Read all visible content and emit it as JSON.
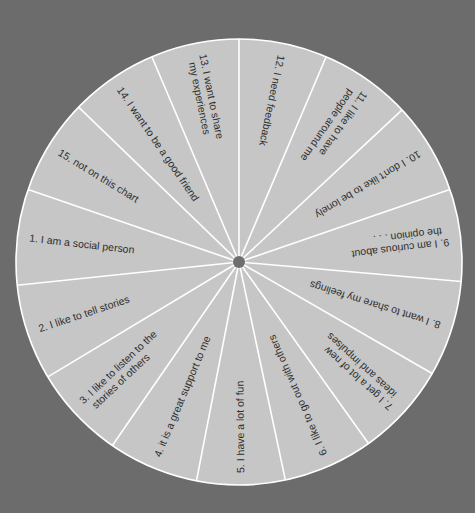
{
  "chart_data": {
    "type": "pie",
    "title": "",
    "center": [
      239,
      262
    ],
    "radius": 223,
    "hub_radius": 6,
    "colors": {
      "background": "#6c6c6c",
      "slice_fill": "#c6c6c6",
      "divider": "#ffffff",
      "hub": "#6e6e6e",
      "text": "#2e2e2e"
    },
    "boundaries_deg": [
      -90,
      -67,
      -43,
      -19,
      5,
      30,
      54.5,
      78,
      101,
      124.6,
      149,
      174,
      199,
      224,
      247
    ],
    "segments": [
      {
        "number": "12.",
        "lines": [
          "12.  I need feedback"
        ],
        "start": -90,
        "end": -67,
        "value": 1
      },
      {
        "number": "11.",
        "lines": [
          "11.  I like to have",
          "people around me"
        ],
        "start": -67,
        "end": -43,
        "value": 1
      },
      {
        "number": "10.",
        "lines": [
          "10.  I don't like to be lonely"
        ],
        "start": -43,
        "end": -19,
        "value": 1
      },
      {
        "number": "9.",
        "lines": [
          "9.  I am curious about",
          "the opinion . . ."
        ],
        "start": -19,
        "end": 5,
        "value": 1
      },
      {
        "number": "8.",
        "lines": [
          "8.  I want to share my feelings"
        ],
        "start": 5,
        "end": 30,
        "value": 1
      },
      {
        "number": "7.",
        "lines": [
          "7.  I get a lot of new",
          "ideas and impulses"
        ],
        "start": 30,
        "end": 54.5,
        "value": 1
      },
      {
        "number": "6.",
        "lines": [
          "6.  I like to go out with others"
        ],
        "start": 54.5,
        "end": 78,
        "value": 1
      },
      {
        "number": "5.",
        "lines": [
          "5.  I have a lot of fun"
        ],
        "start": 78,
        "end": 101,
        "value": 1
      },
      {
        "number": "4.",
        "lines": [
          "4.  it is a great support to me"
        ],
        "start": 101,
        "end": 124.6,
        "value": 1
      },
      {
        "number": "3.",
        "lines": [
          "3.  I like to listen to the",
          "stories of others"
        ],
        "start": 124.6,
        "end": 149,
        "value": 1
      },
      {
        "number": "2.",
        "lines": [
          "2.  I like to tell stories"
        ],
        "start": 149,
        "end": 174,
        "value": 1
      },
      {
        "number": "1.",
        "lines": [
          "1.  I am a social person"
        ],
        "start": 174,
        "end": 199,
        "value": 1
      },
      {
        "number": "15.",
        "lines": [
          "15.  not on this chart"
        ],
        "start": 199,
        "end": 224,
        "value": 1
      },
      {
        "number": "14.",
        "lines": [
          "14.  I want to be a good friend"
        ],
        "start": 224,
        "end": 247,
        "value": 1
      },
      {
        "number": "13.",
        "lines": [
          "13.  I want to share",
          "my experiences"
        ],
        "start": 247,
        "end": 270,
        "value": 1
      }
    ],
    "legend": null,
    "grid": false
  }
}
